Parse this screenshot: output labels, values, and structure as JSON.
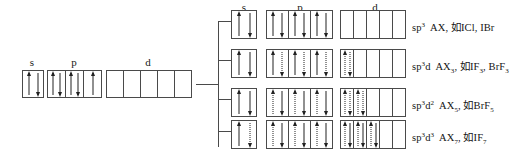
{
  "diagram": {
    "labels": {
      "s": "s",
      "p": "p",
      "d": "d"
    },
    "ground_state": {
      "name": "ground-state-configuration",
      "s": {
        "label": "s",
        "cells": [
          [
            "up",
            "down"
          ]
        ]
      },
      "p": {
        "label": "p",
        "cells": [
          [
            "up",
            "down"
          ],
          [
            "up",
            "down"
          ],
          [
            "up"
          ]
        ]
      },
      "d": {
        "label": "d",
        "cells": [
          [],
          [],
          [],
          [],
          []
        ]
      }
    },
    "excited_states": [
      {
        "name": "sp3",
        "s": {
          "cells": [
            [
              "up",
              "down"
            ]
          ]
        },
        "p": {
          "cells": [
            [
              "up",
              "down"
            ],
            [
              "up",
              "down"
            ],
            [
              "up",
              "down"
            ]
          ]
        },
        "d": {
          "cells": [
            [],
            [],
            [],
            [],
            []
          ]
        },
        "text_plain": "sp3 AX, 如ICl, IBr",
        "hybrid": "sp",
        "hybrid_sup": "3",
        "hybrid_d": "",
        "hybrid_d_sup": "",
        "formula": "AX",
        "formula_sub": "",
        "examples_prefix": ", 如",
        "examples": "ICl, IBr"
      },
      {
        "name": "sp3d",
        "s": {
          "cells": [
            [
              "up",
              "down"
            ]
          ]
        },
        "p": {
          "cells": [
            [
              "up",
              "down-dot"
            ],
            [
              "up",
              "down-dot"
            ],
            [
              "up",
              "down-dot"
            ]
          ]
        },
        "d": {
          "cells": [
            [
              "up-dot",
              "down-dot"
            ],
            [],
            [],
            [],
            []
          ]
        },
        "text_plain": "sp3d AX3, 如IF3, BrF3",
        "hybrid": "sp",
        "hybrid_sup": "3",
        "hybrid_d": "d",
        "hybrid_d_sup": "",
        "formula": "AX",
        "formula_sub": "3",
        "examples_prefix": ", 如",
        "examples": "IF3, BrF3"
      },
      {
        "name": "sp3d2",
        "s": {
          "cells": [
            [
              "up",
              "down"
            ]
          ]
        },
        "p": {
          "cells": [
            [
              "up-dot",
              "down"
            ],
            [
              "up-dot",
              "down"
            ],
            [
              "up-dot",
              "down"
            ]
          ]
        },
        "d": {
          "cells": [
            [
              "up-dot",
              "down-dot"
            ],
            [
              "up-dot",
              "down-dot"
            ],
            [],
            [],
            []
          ]
        },
        "text_plain": "sp3d2 AX5, 如BrF5",
        "hybrid": "sp",
        "hybrid_sup": "3",
        "hybrid_d": "d",
        "hybrid_d_sup": "2",
        "formula": "AX",
        "formula_sub": "5",
        "examples_prefix": ", 如",
        "examples": "BrF5"
      },
      {
        "name": "sp3d3",
        "s": {
          "cells": [
            [
              "up",
              "down-dot"
            ]
          ]
        },
        "p": {
          "cells": [
            [
              "up-dot",
              "down"
            ],
            [
              "up-dot",
              "down"
            ],
            [
              "up-dot",
              "down"
            ]
          ]
        },
        "d": {
          "cells": [
            [
              "up-dot",
              "down"
            ],
            [
              "up-dot",
              "down"
            ],
            [
              "up-dot",
              "down"
            ],
            [],
            []
          ]
        },
        "text_plain": "sp3d3 AX7, 如IF7",
        "hybrid": "sp",
        "hybrid_sup": "3",
        "hybrid_d": "d",
        "hybrid_d_sup": "3",
        "formula": "AX",
        "formula_sub": "7",
        "examples_prefix": ", 如",
        "examples": "IF7"
      }
    ]
  }
}
